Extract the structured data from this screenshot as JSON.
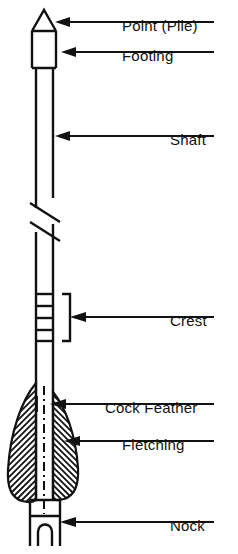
{
  "diagram": {
    "stroke_color": "#111111",
    "background_color": "#ffffff",
    "labels": [
      {
        "id": "point-pile",
        "text": "Point (Pile)",
        "text_x": 122,
        "text_y": 27,
        "leader_x1": 214,
        "leader_x2": 62,
        "leader_y": 22,
        "arrow_tip_x": 55
      },
      {
        "id": "footing",
        "text": "Footing",
        "text_x": 122,
        "text_y": 57,
        "leader_x1": 214,
        "leader_x2": 68,
        "leader_y": 52,
        "arrow_tip_x": 61
      },
      {
        "id": "shaft",
        "text": "Shaft",
        "text_x": 170,
        "text_y": 141,
        "leader_x1": 214,
        "leader_x2": 62,
        "leader_y": 136,
        "arrow_tip_x": 55
      },
      {
        "id": "crest",
        "text": "Crest",
        "text_x": 170,
        "text_y": 322,
        "leader_x1": 214,
        "leader_x2": 78,
        "leader_y": 317,
        "arrow_tip_x": 70
      },
      {
        "id": "cock-feather",
        "text": "Cock Feather",
        "text_x": 105,
        "text_y": 409,
        "leader_x1": 214,
        "leader_x2": 57,
        "leader_y": 404,
        "arrow_tip_x": 50
      },
      {
        "id": "fletching",
        "text": "Fletching",
        "text_x": 122,
        "text_y": 446,
        "leader_x1": 214,
        "leader_x2": 72,
        "leader_y": 441,
        "arrow_tip_x": 64
      },
      {
        "id": "nock",
        "text": "Nock",
        "text_x": 170,
        "text_y": 527,
        "leader_x1": 214,
        "leader_x2": 68,
        "leader_y": 522,
        "arrow_tip_x": 60
      }
    ],
    "parts": {
      "point": {
        "apex_x": 44,
        "apex_y": 10,
        "base_y": 31,
        "left_x": 32,
        "right_x": 56
      },
      "footing": {
        "top_y": 31,
        "bottom_y": 68,
        "left_x": 32,
        "right_x": 56
      },
      "shaft": {
        "top_y": 68,
        "bottom_y": 500,
        "left_x": 36,
        "right_x": 53
      },
      "break_symbol": {
        "center_y": 218,
        "line_count": 2
      },
      "crest": {
        "top_y": 294,
        "bottom_y": 341,
        "band_count": 5
      },
      "fletching": {
        "top_y": 383,
        "bottom_y": 502,
        "hatch_count": 26
      },
      "nock": {
        "top_y": 500,
        "bottom_y": 546,
        "left_x": 30,
        "right_x": 60,
        "notch_depth": 24
      }
    }
  }
}
